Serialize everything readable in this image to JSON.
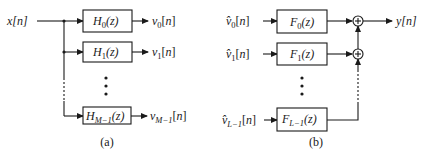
{
  "analysis": {
    "caption": "(a)",
    "input_label": "x[n]",
    "filters": [
      {
        "name": "H",
        "sub": "0",
        "arg": "(z)",
        "output_name": "v",
        "output_sub": "0",
        "output_arg": "[n]"
      },
      {
        "name": "H",
        "sub": "1",
        "arg": "(z)",
        "output_name": "v",
        "output_sub": "1",
        "output_arg": "[n]"
      },
      {
        "name": "H",
        "sub": "M−1",
        "arg": "(z)",
        "output_name": "v",
        "output_sub": "M−1",
        "output_arg": "[n]"
      }
    ]
  },
  "synthesis": {
    "caption": "(b)",
    "output_label": "y[n]",
    "filters": [
      {
        "name": "F",
        "sub": "0",
        "arg": "(z)",
        "input_name": "v̂",
        "input_sub": "0",
        "input_arg": "[n]"
      },
      {
        "name": "F",
        "sub": "1",
        "arg": "(z)",
        "input_name": "v̂",
        "input_sub": "1",
        "input_arg": "[n]"
      },
      {
        "name": "F",
        "sub": "L−1",
        "arg": "(z)",
        "input_name": "v̂",
        "input_sub": "L−1",
        "input_arg": "[n]"
      }
    ],
    "adder_symbol": "+"
  },
  "colors": {
    "stroke": "#1a1a1a",
    "background": "#ffffff"
  }
}
